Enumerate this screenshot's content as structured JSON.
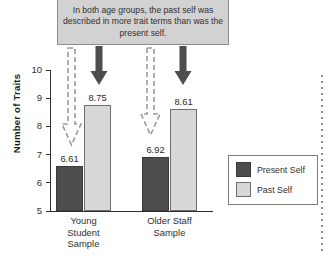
{
  "callout": {
    "text": "In both age groups, the past self was described in more trait terms than was the present self."
  },
  "legend": {
    "items": [
      {
        "label": "Present Self",
        "color": "#4d4d4d",
        "icon": "legend-swatch-present-self"
      },
      {
        "label": "Past Self",
        "color": "#d8d8d8",
        "icon": "legend-swatch-past-self"
      }
    ]
  },
  "annotations": {
    "arrow_past_self": "dashed-outline-down-arrow",
    "arrow_present_self": "solid-down-arrow",
    "right_margin_rule": "vertical-dotted-rule"
  },
  "chart_data": {
    "type": "bar",
    "title": "",
    "xlabel": "",
    "ylabel": "Number of Traits",
    "ylim": [
      5,
      10
    ],
    "yticks": [
      5,
      6,
      7,
      8,
      9,
      10
    ],
    "ytick_labels": [
      "5",
      "6",
      "7",
      "8",
      "9",
      "10"
    ],
    "grid": false,
    "legend_position": "right-bottom",
    "categories": [
      "Young Student Sample",
      "Older Staff Sample"
    ],
    "category_label_lines": [
      [
        "Young",
        "Student",
        "Sample"
      ],
      [
        "Older Staff",
        "Sample"
      ]
    ],
    "series": [
      {
        "name": "Present Self",
        "color": "#4d4d4d",
        "values": [
          6.61,
          6.92
        ],
        "value_labels": [
          "6.61",
          "6.92"
        ]
      },
      {
        "name": "Past Self",
        "color": "#d8d8d8",
        "values": [
          8.75,
          8.61
        ],
        "value_labels": [
          "8.75",
          "8.61"
        ]
      }
    ]
  }
}
